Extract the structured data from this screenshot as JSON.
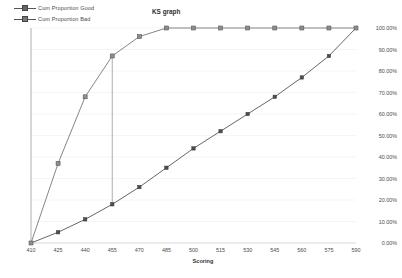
{
  "chart": {
    "title": "KS graph",
    "xlabel": "Scoring",
    "ylabel": ""
  },
  "legend": {
    "position": "top-left",
    "items": [
      {
        "label": "Cum Proportion Good",
        "marker": "diamond-marker-icon",
        "color": "#555555"
      },
      {
        "label": "Cum Proportion Bad",
        "marker": "square-marker-icon",
        "color": "#777777"
      }
    ]
  },
  "axes": {
    "x_ticks": [
      "410",
      "425",
      "440",
      "455",
      "470",
      "485",
      "500",
      "515",
      "530",
      "545",
      "560",
      "575",
      "590"
    ],
    "y_ticks": [
      "0.00%",
      "10.00%",
      "20.00%",
      "30.00%",
      "40.00%",
      "50.00%",
      "60.00%",
      "70.00%",
      "80.00%",
      "90.00%",
      "100.00%"
    ]
  },
  "annotations": {
    "ks_line": {
      "x": 455,
      "y_low": 18,
      "y_high": 87,
      "name": "ks-distance-line"
    }
  },
  "chart_data": {
    "type": "line",
    "title": "KS graph",
    "xlabel": "Scoring",
    "ylabel": "",
    "xlim": [
      410,
      590
    ],
    "ylim": [
      0,
      100
    ],
    "grid": true,
    "legend_position": "top-left",
    "x": [
      410,
      425,
      440,
      455,
      470,
      485,
      500,
      515,
      530,
      545,
      560,
      575,
      590
    ],
    "series": [
      {
        "name": "Cum Proportion Good",
        "marker": "diamond",
        "color": "#555555",
        "values": [
          0,
          5,
          11,
          18,
          26,
          35,
          44,
          52,
          60,
          68,
          77,
          87,
          100
        ]
      },
      {
        "name": "Cum Proportion Bad",
        "marker": "square",
        "color": "#777777",
        "values": [
          0,
          37,
          68,
          87,
          96,
          100,
          100,
          100,
          100,
          100,
          100,
          100,
          100
        ]
      }
    ]
  }
}
